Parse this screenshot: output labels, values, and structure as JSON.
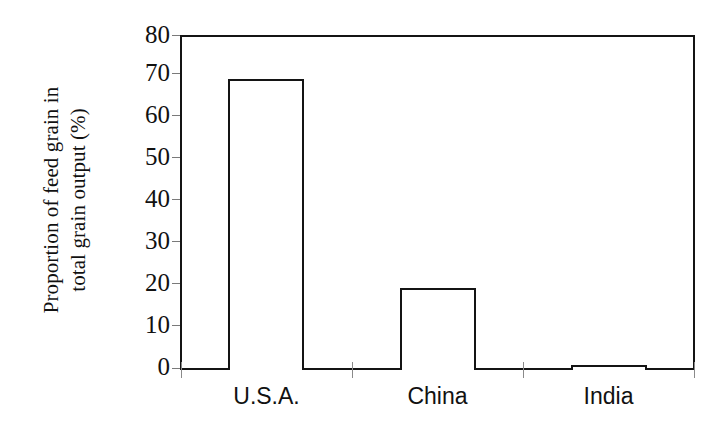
{
  "chart_data": {
    "type": "bar",
    "title": "",
    "subtitle": "",
    "xlabel": "",
    "ylabel": "Proportion of feed grain in total grain output (%)",
    "ylabel_lines": [
      "Proportion of feed grain in",
      "total grain output (%)"
    ],
    "categories": [
      "U.S.A.",
      "China",
      "India"
    ],
    "values": [
      69.5,
      19.5,
      1.3
    ],
    "series": [
      {
        "name": "Proportion of feed grain in total grain output (%)",
        "values": [
          69.5,
          19.5,
          1.3
        ]
      }
    ],
    "ylim": [
      0,
      80
    ],
    "ytick_values": [
      0,
      10,
      20,
      30,
      40,
      50,
      60,
      70,
      80
    ],
    "ytick_labels": [
      "0",
      "10",
      "20",
      "30",
      "40",
      "50",
      "60",
      "70",
      "80"
    ],
    "grid": false,
    "legend": false,
    "legend_position": "none",
    "bar_fill_color": "#ffffff",
    "bar_edge_color": "#141414",
    "axis_color": "#141414",
    "background_color": "#ffffff",
    "text_color": "#111111"
  }
}
